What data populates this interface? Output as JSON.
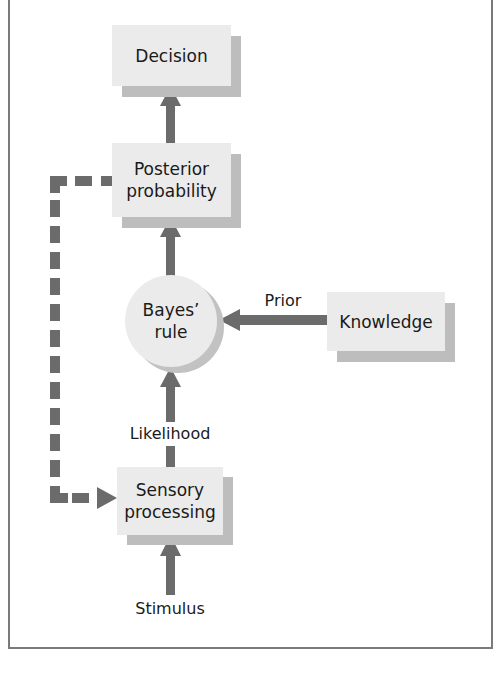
{
  "diagram": {
    "nodes": {
      "decision": {
        "label": "Decision"
      },
      "posterior": {
        "label_line1": "Posterior",
        "label_line2": "probability"
      },
      "bayes": {
        "label_line1": "Bayes’",
        "label_line2": "rule"
      },
      "knowledge": {
        "label": "Knowledge"
      },
      "sensory": {
        "label_line1": "Sensory",
        "label_line2": "processing"
      }
    },
    "edge_labels": {
      "prior": "Prior",
      "likelihood": "Likelihood",
      "stimulus": "Stimulus"
    },
    "edges": [
      {
        "from": "Stimulus",
        "to": "Sensory processing",
        "style": "solid"
      },
      {
        "from": "Sensory processing",
        "to": "Bayes' rule",
        "label": "Likelihood",
        "style": "solid"
      },
      {
        "from": "Knowledge",
        "to": "Bayes' rule",
        "label": "Prior",
        "style": "solid"
      },
      {
        "from": "Bayes' rule",
        "to": "Posterior probability",
        "style": "solid"
      },
      {
        "from": "Posterior probability",
        "to": "Decision",
        "style": "solid"
      },
      {
        "from": "Posterior probability",
        "to": "Sensory processing",
        "style": "dashed"
      }
    ],
    "colors": {
      "node_fill": "#ebebeb",
      "shadow": "#bdbdbd",
      "arrow": "#6b6b6b",
      "border": "#7a7a7a"
    }
  }
}
